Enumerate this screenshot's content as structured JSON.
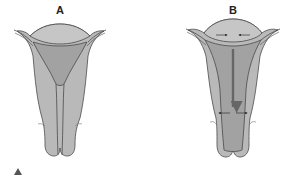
{
  "figure": {
    "panels": [
      {
        "label": "A",
        "description": "uterus-resting-state"
      },
      {
        "label": "B",
        "description": "uterus-contracting-with-arrows"
      }
    ],
    "marker": "triangle-icon",
    "colors": {
      "outer_wall": "#b9b9b9",
      "inner_cavity": "#a0a0a0",
      "fundus": "#c2c2c2",
      "outline": "#4a4a4a",
      "arrow": "#555555"
    }
  }
}
